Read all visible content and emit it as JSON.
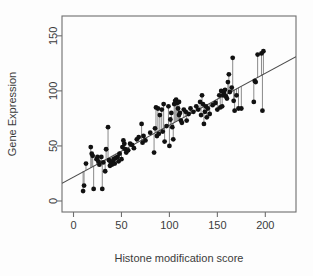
{
  "chart_data": {
    "type": "scatter",
    "title": "",
    "xlabel": "Histone modification score",
    "ylabel": "Gene Expression",
    "xlim": [
      -12,
      232
    ],
    "ylim": [
      -10,
      168
    ],
    "xticks": [
      0,
      50,
      100,
      150,
      200
    ],
    "yticks": [
      0,
      50,
      100,
      150
    ],
    "grid": false,
    "legend": null,
    "point_color": "#111111",
    "line_color": "#4a4a4a",
    "residual_color": "#8a8a8a",
    "regression_line": {
      "intercept": 22,
      "slope": 0.47,
      "x_start": -12,
      "x_end": 232,
      "y_start": 16,
      "y_end": 131
    },
    "series": [
      {
        "name": "observations",
        "x": [
          10,
          11,
          13,
          18,
          19,
          20,
          21,
          24,
          25,
          26,
          27,
          29,
          30,
          31,
          33,
          34,
          36,
          37,
          38,
          39,
          40,
          41,
          42,
          43,
          44,
          46,
          47,
          48,
          50,
          51,
          52,
          53,
          54,
          55,
          57,
          59,
          61,
          63,
          66,
          68,
          71,
          72,
          73,
          75,
          80,
          84,
          85,
          86,
          87,
          88,
          89,
          90,
          92,
          93,
          94,
          95,
          97,
          99,
          100,
          101,
          102,
          103,
          104,
          105,
          106,
          107,
          108,
          109,
          110,
          110,
          111,
          112,
          113,
          115,
          117,
          118,
          120,
          122,
          125,
          128,
          130,
          132,
          133,
          134,
          135,
          136,
          137,
          138,
          139,
          140,
          142,
          145,
          148,
          150,
          152,
          153,
          154,
          155,
          156,
          157,
          158,
          159,
          160,
          161,
          162,
          163,
          165,
          166,
          167,
          168,
          170,
          172,
          175,
          188,
          189,
          190,
          192,
          196,
          197,
          198
        ],
        "y": [
          9,
          14,
          34,
          49,
          43,
          41,
          11,
          38,
          40,
          36,
          33,
          40,
          11,
          35,
          27,
          47,
          67,
          37,
          32,
          35,
          33,
          36,
          38,
          34,
          39,
          40,
          36,
          43,
          38,
          49,
          55,
          52,
          47,
          44,
          46,
          52,
          51,
          48,
          56,
          58,
          70,
          53,
          59,
          55,
          62,
          44,
          66,
          85,
          59,
          84,
          61,
          78,
          83,
          63,
          88,
          54,
          68,
          86,
          50,
          74,
          80,
          67,
          56,
          88,
          91,
          92,
          89,
          84,
          90,
          78,
          80,
          73,
          71,
          83,
          81,
          73,
          79,
          84,
          81,
          86,
          83,
          90,
          78,
          96,
          88,
          70,
          81,
          86,
          76,
          84,
          79,
          87,
          89,
          83,
          96,
          85,
          100,
          86,
          96,
          98,
          101,
          95,
          93,
          108,
          115,
          99,
          103,
          130,
          91,
          82,
          96,
          84,
          84,
          90,
          109,
          108,
          133,
          134,
          82,
          136
        ]
      }
    ],
    "fitted_values": [
      27,
      27,
      28,
      30,
      31,
      31,
      32,
      33,
      34,
      34,
      35,
      36,
      36,
      37,
      38,
      38,
      39,
      39,
      40,
      40,
      41,
      41,
      42,
      42,
      43,
      44,
      44,
      45,
      45,
      46,
      46,
      47,
      47,
      48,
      49,
      50,
      51,
      52,
      53,
      54,
      55,
      56,
      56,
      57,
      60,
      61,
      62,
      62,
      63,
      63,
      64,
      64,
      65,
      66,
      66,
      67,
      68,
      69,
      69,
      69,
      70,
      70,
      71,
      71,
      72,
      72,
      73,
      73,
      74,
      74,
      74,
      75,
      75,
      76,
      77,
      78,
      79,
      79,
      81,
      82,
      83,
      84,
      85,
      85,
      86,
      86,
      86,
      87,
      87,
      88,
      89,
      90,
      92,
      93,
      94,
      94,
      95,
      95,
      95,
      96,
      96,
      97,
      97,
      98,
      98,
      99,
      100,
      100,
      101,
      101,
      102,
      103,
      104,
      110,
      111,
      111,
      112,
      114,
      115,
      115
    ]
  }
}
